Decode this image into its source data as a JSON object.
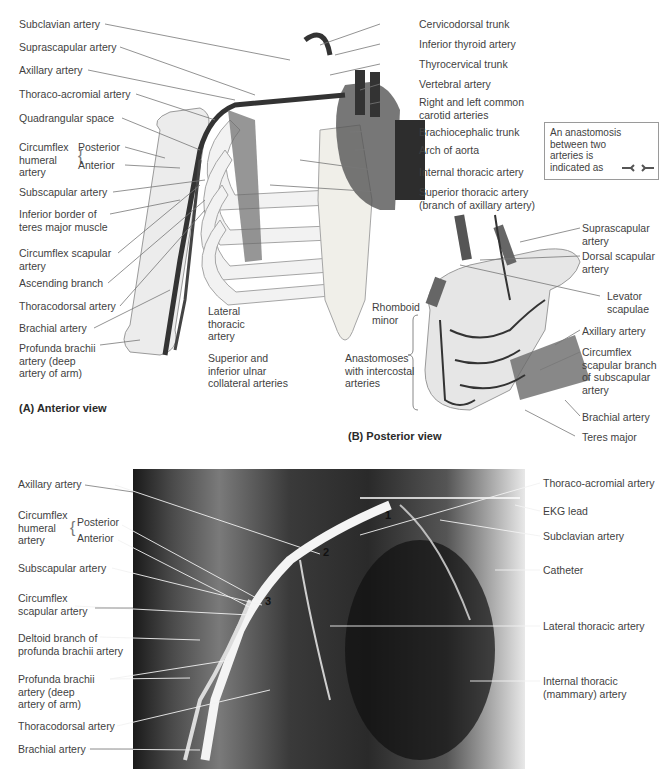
{
  "figure": {
    "panel_a": {
      "caption": "(A) Anterior view",
      "labels_left": [
        "Subclavian artery",
        "Suprascapular artery",
        "Axillary artery",
        "Thoraco-acromial artery",
        "Quadrangular space",
        "Circumflex humeral artery",
        "Posterior",
        "Anterior",
        "Subscapular artery",
        "Inferior border of teres major muscle",
        "Circumflex scapular artery",
        "Ascending branch",
        "Thoracodorsal artery",
        "Brachial artery",
        "Profunda brachii artery (deep artery of arm)"
      ],
      "labels_bottom": [
        "Lateral thoracic artery",
        "Superior and inferior ulnar collateral arteries"
      ],
      "labels_right": [
        "Cervicodorsal trunk",
        "Inferior thyroid artery",
        "Thyrocervical trunk",
        "Vertebral artery",
        "Right and left common carotid arteries",
        "Brachiocephalic trunk",
        "Arch of aorta",
        "Internal thoracic artery",
        "Superior thoracic artery (branch of axillary artery)"
      ]
    },
    "legend": {
      "text": "An anastomosis\nbetween two\narteries is\nindicated as",
      "symbol": "anastomosis-symbol"
    },
    "panel_b": {
      "caption": "(B) Posterior view",
      "labels_left": [
        "Rhomboid minor",
        "Anastomoses with intercostal arteries"
      ],
      "labels_right": [
        "Suprascapular artery",
        "Dorsal scapular artery",
        "Levator scapulae",
        "Axillary artery",
        "Circumflex scapular branch of subscapular artery",
        "Brachial artery",
        "Teres major"
      ]
    },
    "panel_c": {
      "labels_left": [
        "Axillary artery",
        "Circumflex humeral artery",
        "Posterior",
        "Anterior",
        "Subscapular artery",
        "Circumflex scapular artery",
        "Deltoid branch of profunda brachii artery",
        "Profunda brachii artery (deep artery of arm)",
        "Thoracodorsal artery",
        "Brachial artery"
      ],
      "labels_right": [
        "Thoraco-acromial artery",
        "EKG lead",
        "Subclavian artery",
        "Catheter",
        "Lateral thoracic artery",
        "Internal thoracic (mammary) artery"
      ],
      "segment_numbers": [
        "1",
        "2",
        "3"
      ]
    }
  }
}
